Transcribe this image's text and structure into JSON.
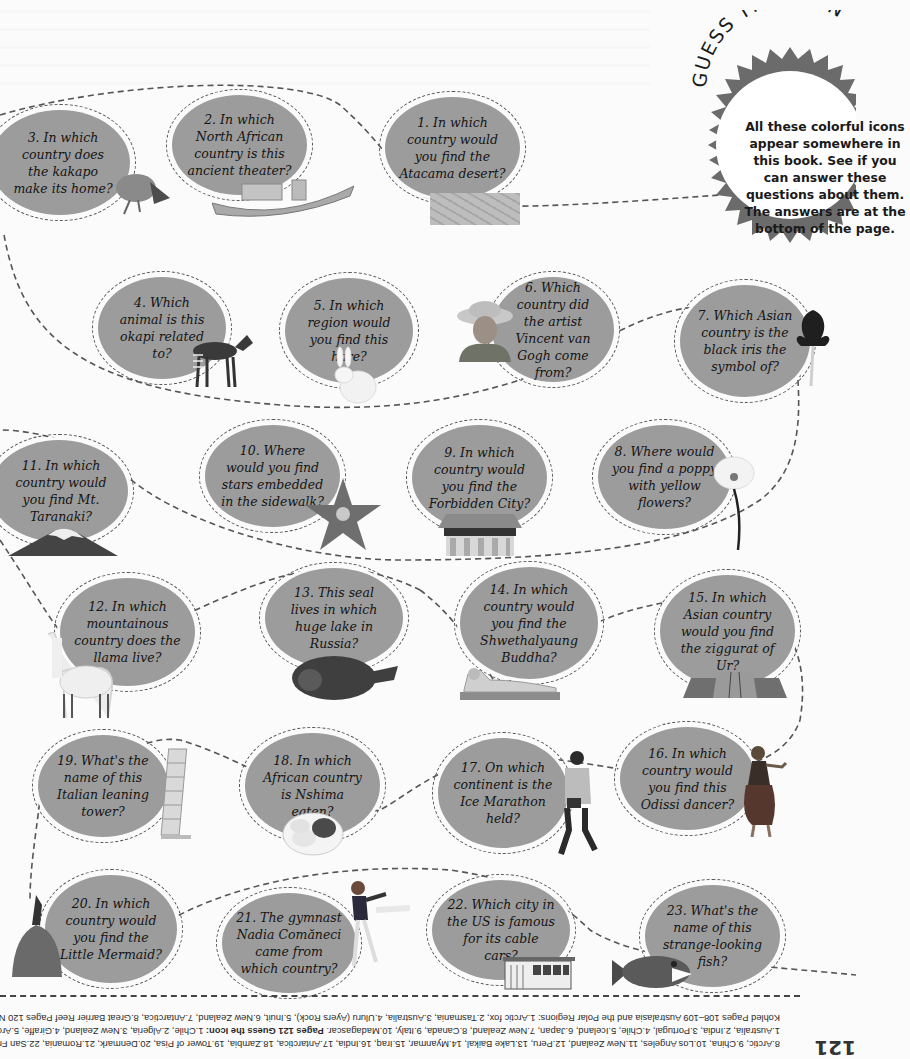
{
  "page": {
    "title": "GUESS THE ICON",
    "intro": "All these colorful icons appear somewhere in this book. See if you can answer these questions about them. The answers are at the bottom of the page.",
    "page_number": "121"
  },
  "colors": {
    "bubble": "#9c9c9c",
    "badge": "#6b6b6b",
    "dash": "#555555",
    "background": "#fbfbfb"
  },
  "questions": [
    {
      "n": 1,
      "text": "1. In which country would you find the Atacama desert?",
      "icon": "desert-icon"
    },
    {
      "n": 2,
      "text": "2. In which North African country is this ancient theater?",
      "icon": "ancient-theater-icon"
    },
    {
      "n": 3,
      "text": "3. In which country does the kakapo make its home?",
      "icon": "kakapo-parrot-icon"
    },
    {
      "n": 4,
      "text": "4. Which animal is this okapi related to?",
      "icon": "okapi-icon"
    },
    {
      "n": 5,
      "text": "5. In which region would you find this hare?",
      "icon": "arctic-hare-icon"
    },
    {
      "n": 6,
      "text": "6. Which country did the artist Vincent van Gogh come from?",
      "icon": "van-gogh-portrait-icon"
    },
    {
      "n": 7,
      "text": "7. Which Asian country is the black iris the symbol of?",
      "icon": "black-iris-icon"
    },
    {
      "n": 8,
      "text": "8. Where would you find a poppy with yellow flowers?",
      "icon": "poppy-icon"
    },
    {
      "n": 9,
      "text": "9. In which country would you find the Forbidden City?",
      "icon": "forbidden-city-icon"
    },
    {
      "n": 10,
      "text": "10. Where would you find stars embedded in the sidewalk?",
      "icon": "walk-of-fame-star-icon"
    },
    {
      "n": 11,
      "text": "11. In which country would you find Mt. Taranaki?",
      "icon": "mountain-icon"
    },
    {
      "n": 12,
      "text": "12. In which mountainous country does the llama live?",
      "icon": "llama-icon"
    },
    {
      "n": 13,
      "text": "13. This seal lives in which huge lake in Russia?",
      "icon": "seal-icon"
    },
    {
      "n": 14,
      "text": "14. In which country would you find the Shwethalyaung Buddha?",
      "icon": "reclining-buddha-icon"
    },
    {
      "n": 15,
      "text": "15. In which Asian country would you find the ziggurat of Ur?",
      "icon": "ziggurat-icon"
    },
    {
      "n": 16,
      "text": "16. In which country would you find this Odissi dancer?",
      "icon": "odissi-dancer-icon"
    },
    {
      "n": 17,
      "text": "17. On which continent is the Ice Marathon held?",
      "icon": "marathon-runner-icon"
    },
    {
      "n": 18,
      "text": "18. In which African country is Nshima eaten?",
      "icon": "nshima-dish-icon"
    },
    {
      "n": 19,
      "text": "19. What's the name of this Italian leaning tower?",
      "icon": "leaning-tower-icon"
    },
    {
      "n": 20,
      "text": "20. In which country would you find the Little Mermaid?",
      "icon": "little-mermaid-icon"
    },
    {
      "n": 21,
      "text": "21. The gymnast Nadia Comăneci came from which country?",
      "icon": "gymnast-icon"
    },
    {
      "n": 22,
      "text": "22. Which city in the US is famous for its cable cars?",
      "icon": "cable-car-icon"
    },
    {
      "n": 23,
      "text": "23. What's the name of this strange-looking fish?",
      "icon": "toothfish-icon"
    }
  ],
  "footer": {
    "line1": "Kohled Pages 108–109 Australasia and the Polar Regions: 1.Arctic fox, 2.Tasmania, 3.Australia, 4.Uluru (Ayers Rock), 5.Inuit, 6.New Zealand, 7.Antarctica, 8.Great Barrier Reef Pages 120 Name the country:",
    "line2_pre": "1.Australia, 2.India, 3.Portugal, 4.Chile, 5.Iceland, 6.Japan, 7.New Zealand, 8.Canada, 9.Italy, 10.Madagascar. ",
    "line2_bold": "Pages 121 Guess the Icon:",
    "line2_post": " 1.Chile, 2.Algeria, 3.New Zealand, 4.Giraffe, 5.Arctic, 6.Netherlands, 7.Jordan,",
    "line3": "8.Arctic, 9.China, 10.Los Angeles, 11.New Zealand, 12.Peru, 13.Lake Baikal, 14.Myanmar, 15.Iraq, 16.India, 17.Antarctica, 18.Zambia, 19.Tower of Pisa, 20.Denmark, 21.Romania, 22.San Francisco, 23.Patagonian toothfish."
  }
}
